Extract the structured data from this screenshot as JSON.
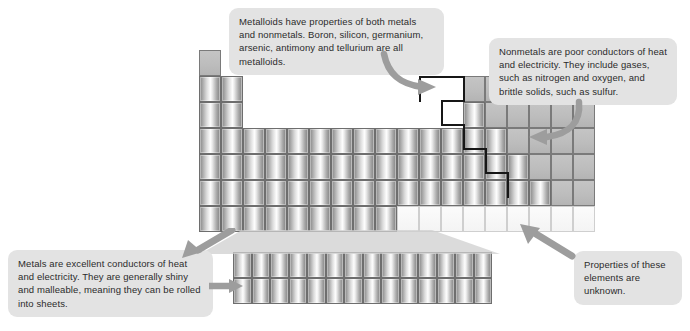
{
  "diagram": {
    "callouts": [
      {
        "id": "metalloids",
        "text": "Metalloids have properties of both metals and nonmetals. Boron, silicon, germanium, arsenic, antimony and tellurium are all metalloids."
      },
      {
        "id": "nonmetals",
        "text": "Nonmetals are poor conductors of heat and electricity. They include gases, such as nitrogen and oxygen, and brittle solids, such as sulfur."
      },
      {
        "id": "metals",
        "text": "Metals are excellent conductors of heat and electricity. They are generally shiny and malleable, meaning they can be rolled into sheets."
      },
      {
        "id": "unknown",
        "text": "Properties of these elements are unknown."
      }
    ],
    "legend_colors": {
      "metal": "#c9c9c9",
      "nonmetal": "#bdbdbd",
      "unknown": "#f7f7f7",
      "metalloid_boundary": "#171717",
      "callout_background": "#e3e3e3",
      "arrow": "#9a9a9a"
    },
    "table": {
      "columns": 18,
      "rows": 7,
      "cell_width": 22,
      "cell_height": 26,
      "origin_x": 199,
      "origin_y": 50,
      "inner_block": {
        "rows": 2,
        "columns": 14,
        "origin_x": 233,
        "origin_y": 252,
        "cell_width": 18.5,
        "cell_height": 26
      },
      "grid": [
        [
          "nonmetal",
          null,
          null,
          null,
          null,
          null,
          null,
          null,
          null,
          null,
          null,
          null,
          null,
          null,
          null,
          null,
          null,
          null
        ],
        [
          "metal",
          "metal",
          null,
          null,
          null,
          null,
          null,
          null,
          null,
          null,
          null,
          null,
          "nonmetal",
          "nonmetal",
          "nonmetal",
          "nonmetal",
          "nonmetal",
          "nonmetal"
        ],
        [
          "metal",
          "metal",
          null,
          null,
          null,
          null,
          null,
          null,
          null,
          null,
          null,
          null,
          "metal",
          "nonmetal",
          "nonmetal",
          "nonmetal",
          "nonmetal",
          "nonmetal"
        ],
        [
          "metal",
          "metal",
          "metal",
          "metal",
          "metal",
          "metal",
          "metal",
          "metal",
          "metal",
          "metal",
          "metal",
          "metal",
          "metal",
          "metal",
          "nonmetal",
          "nonmetal",
          "nonmetal",
          "nonmetal"
        ],
        [
          "metal",
          "metal",
          "metal",
          "metal",
          "metal",
          "metal",
          "metal",
          "metal",
          "metal",
          "metal",
          "metal",
          "metal",
          "metal",
          "metal",
          "metal",
          "nonmetal",
          "nonmetal",
          "nonmetal"
        ],
        [
          "metal",
          "metal",
          "metal",
          "metal",
          "metal",
          "metal",
          "metal",
          "metal",
          "metal",
          "metal",
          "metal",
          "metal",
          "metal",
          "metal",
          "metal",
          "metal",
          "nonmetal",
          "nonmetal"
        ],
        [
          "metal",
          "metal",
          "metal",
          "metal",
          "metal",
          "metal",
          "metal",
          "metal",
          "metal",
          "unknown",
          "unknown",
          "unknown",
          "unknown",
          "unknown",
          "unknown",
          "unknown",
          "unknown",
          "unknown"
        ]
      ],
      "staircase_segments": [
        {
          "x": 463,
          "y": 76,
          "w": 2,
          "h": 26
        },
        {
          "x": 441,
          "y": 100,
          "w": 24,
          "h": 2
        },
        {
          "x": 441,
          "y": 100,
          "w": 2,
          "h": 26
        },
        {
          "x": 441,
          "y": 124,
          "w": 24,
          "h": 2
        },
        {
          "x": 463,
          "y": 124,
          "w": 2,
          "h": 26
        },
        {
          "x": 463,
          "y": 148,
          "w": 24,
          "h": 2
        },
        {
          "x": 485,
          "y": 148,
          "w": 2,
          "h": 26
        },
        {
          "x": 485,
          "y": 172,
          "w": 24,
          "h": 2
        },
        {
          "x": 507,
          "y": 172,
          "w": 2,
          "h": 26
        },
        {
          "x": 419,
          "y": 76,
          "w": 46,
          "h": 2
        },
        {
          "x": 419,
          "y": 76,
          "w": 2,
          "h": 26
        }
      ]
    }
  }
}
